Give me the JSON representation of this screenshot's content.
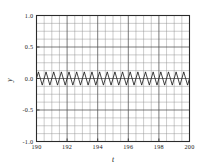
{
  "figure": {
    "background_color": "#ffffff",
    "line_color": "#111111",
    "grid_color": "#8c8c8c",
    "grid_major_color": "#4d4d4d",
    "frame_color": "#2b2b2b"
  },
  "axis_titles": {
    "x": "t",
    "y": "y"
  },
  "ticks": {
    "y_labels": [
      "1.0",
      "0.5",
      "0.0",
      "-0.5",
      "-1.0"
    ],
    "y_values": [
      1.0,
      0.5,
      0.0,
      -0.5,
      -1.0
    ],
    "x_labels": [
      "190",
      "192",
      "194",
      "196",
      "198",
      "200"
    ],
    "x_values": [
      190,
      192,
      194,
      196,
      198,
      200
    ]
  },
  "chart_data": {
    "type": "line",
    "title": "",
    "subtitle": "",
    "xlabel": "t",
    "ylabel": "y",
    "xlim": [
      190,
      200
    ],
    "ylim": [
      -1.0,
      1.0
    ],
    "grid": true,
    "grid_minor_x_step": 0.5,
    "grid_minor_y_step": 0.125,
    "grid_major_x_step": 2,
    "grid_major_y_step": 0.5,
    "legend": null,
    "legend_position": "none",
    "annotations": [],
    "series": [
      {
        "name": "y(t)",
        "description": "small-amplitude triangular oscillation about zero",
        "waveform": "triangular",
        "period": 0.5,
        "amplitude": 0.105,
        "offset": 0.0,
        "cycles": 20,
        "x": [
          190.0,
          190.125,
          190.25,
          190.375,
          190.5,
          190.625,
          190.75,
          190.875,
          191.0,
          191.125,
          191.25,
          191.375,
          191.5,
          191.625,
          191.75,
          191.875,
          192.0,
          192.125,
          192.25,
          192.375,
          192.5,
          192.625,
          192.75,
          192.875,
          193.0,
          193.125,
          193.25,
          193.375,
          193.5,
          193.625,
          193.75,
          193.875,
          194.0,
          194.125,
          194.25,
          194.375,
          194.5,
          194.625,
          194.75,
          194.875,
          195.0,
          195.125,
          195.25,
          195.375,
          195.5,
          195.625,
          195.75,
          195.875,
          196.0,
          196.125,
          196.25,
          196.375,
          196.5,
          196.625,
          196.75,
          196.875,
          197.0,
          197.125,
          197.25,
          197.375,
          197.5,
          197.625,
          197.75,
          197.875,
          198.0,
          198.125,
          198.25,
          198.375,
          198.5,
          198.625,
          198.75,
          198.875,
          199.0,
          199.125,
          199.25,
          199.375,
          199.5,
          199.625,
          199.75,
          199.875,
          200.0
        ],
        "y": [
          0.0,
          0.105,
          0.0,
          -0.105,
          0.0,
          0.105,
          0.0,
          -0.105,
          0.0,
          0.105,
          0.0,
          -0.105,
          0.0,
          0.105,
          0.0,
          -0.105,
          0.0,
          0.105,
          0.0,
          -0.105,
          0.0,
          0.105,
          0.0,
          -0.105,
          0.0,
          0.105,
          0.0,
          -0.105,
          0.0,
          0.105,
          0.0,
          -0.105,
          0.0,
          0.105,
          0.0,
          -0.105,
          0.0,
          0.105,
          0.0,
          -0.105,
          0.0,
          0.105,
          0.0,
          -0.105,
          0.0,
          0.105,
          0.0,
          -0.105,
          0.0,
          0.105,
          0.0,
          -0.105,
          0.0,
          0.105,
          0.0,
          -0.105,
          0.0,
          0.105,
          0.0,
          -0.105,
          0.0,
          0.105,
          0.0,
          -0.105,
          0.0,
          0.105,
          0.0,
          -0.105,
          0.0,
          0.105,
          0.0,
          -0.105,
          0.0,
          0.105,
          0.0,
          -0.105,
          0.0,
          0.105,
          0.0,
          -0.105,
          0.0
        ]
      }
    ]
  }
}
